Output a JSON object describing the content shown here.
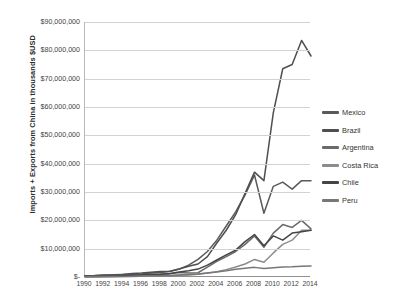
{
  "chart_data": {
    "type": "line",
    "title": "",
    "xlabel": "",
    "ylabel": "Imports + Exports from China in thousands $USD",
    "xlim": [
      1990,
      2014
    ],
    "ylim": [
      0,
      90000000
    ],
    "grid": true,
    "legend_position": "right",
    "x": [
      1990,
      1991,
      1992,
      1993,
      1994,
      1995,
      1996,
      1997,
      1998,
      1999,
      2000,
      2001,
      2002,
      2003,
      2004,
      2005,
      2006,
      2007,
      2008,
      2009,
      2010,
      2011,
      2012,
      2013,
      2014
    ],
    "y_ticks": [
      0,
      10000000,
      20000000,
      30000000,
      40000000,
      50000000,
      60000000,
      70000000,
      80000000,
      90000000
    ],
    "y_tick_labels": [
      "$-",
      "$10,000,000",
      "$20,000,000",
      "$30,000,000",
      "$40,000,000",
      "$50,000,000",
      "$60,000,000",
      "$70,000,000",
      "$80,000,000",
      "$90,000,000"
    ],
    "x_tick_labels": [
      "1990",
      "1992",
      "1994",
      "1996",
      "1998",
      "2000",
      "2002",
      "2004",
      "2006",
      "2008",
      "2010",
      "2012",
      "2014"
    ],
    "series": [
      {
        "name": "Mexico",
        "color": "#5a5a5a",
        "values": [
          400000,
          500000,
          700000,
          800000,
          900000,
          1000000,
          1100000,
          1400000,
          1600000,
          1900000,
          2800000,
          4200000,
          6200000,
          9000000,
          13000000,
          18000000,
          23000000,
          29000000,
          36000000,
          22500000,
          32000000,
          33500000,
          31000000,
          34000000,
          34000000
        ]
      },
      {
        "name": "Brazil",
        "color": "#4f4f4f",
        "values": [
          400000,
          450000,
          600000,
          700000,
          900000,
          1200000,
          1400000,
          1700000,
          1900000,
          2000000,
          2800000,
          3800000,
          4600000,
          7200000,
          12000000,
          16500000,
          22000000,
          29500000,
          37000000,
          34000000,
          58000000,
          73500000,
          75000000,
          83500000,
          78000000
        ]
      },
      {
        "name": "Argentina",
        "color": "#6a6a6a",
        "values": [
          200000,
          250000,
          350000,
          450000,
          550000,
          700000,
          800000,
          900000,
          1000000,
          1100000,
          1600000,
          1400000,
          1500000,
          3500000,
          5500000,
          7200000,
          9000000,
          11500000,
          14500000,
          10500000,
          15500000,
          18500000,
          17500000,
          20000000,
          17000000
        ]
      },
      {
        "name": "Costa Rica",
        "color": "#8c8c8c",
        "values": [
          60000,
          70000,
          90000,
          110000,
          150000,
          200000,
          250000,
          300000,
          380000,
          450000,
          600000,
          750000,
          950000,
          1400000,
          1900000,
          2600000,
          3500000,
          4600000,
          6200000,
          5200000,
          8500000,
          11500000,
          13000000,
          16500000,
          16500000
        ]
      },
      {
        "name": "Chile",
        "color": "#454545",
        "values": [
          150000,
          200000,
          280000,
          350000,
          450000,
          600000,
          750000,
          900000,
          1000000,
          1200000,
          1800000,
          2200000,
          2800000,
          4200000,
          6000000,
          7800000,
          9500000,
          12500000,
          15000000,
          11000000,
          14500000,
          13000000,
          15500000,
          16000000,
          16500000
        ]
      },
      {
        "name": "Peru",
        "color": "#777777",
        "values": [
          80000,
          100000,
          130000,
          160000,
          200000,
          260000,
          320000,
          400000,
          450000,
          520000,
          700000,
          850000,
          1050000,
          1400000,
          1800000,
          2200000,
          2700000,
          3100000,
          3400000,
          3000000,
          3300000,
          3500000,
          3600000,
          3800000,
          3900000
        ]
      }
    ]
  },
  "legend": {
    "items": [
      {
        "label": "Mexico"
      },
      {
        "label": "Brazil"
      },
      {
        "label": "Argentina"
      },
      {
        "label": "Costa Rica"
      },
      {
        "label": "Chile"
      },
      {
        "label": "Peru"
      }
    ]
  }
}
